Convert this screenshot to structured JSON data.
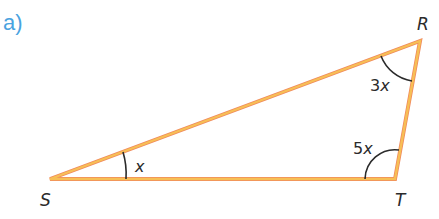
{
  "part_label": "a)",
  "colors": {
    "part_label": "#4aa3df",
    "side_stroke": "#f5b44e",
    "side_stroke_edge": "#f08a5d",
    "arc": "#2b2b2b",
    "text": "#2b2b2b"
  },
  "triangle": {
    "vertices": [
      {
        "name": "S",
        "label": "S"
      },
      {
        "name": "R",
        "label": "R"
      },
      {
        "name": "T",
        "label": "T"
      }
    ],
    "angles": [
      {
        "at": "S",
        "coef": "",
        "var": "x"
      },
      {
        "at": "R",
        "coef": "3",
        "var": "x"
      },
      {
        "at": "T",
        "coef": "5",
        "var": "x"
      }
    ]
  }
}
